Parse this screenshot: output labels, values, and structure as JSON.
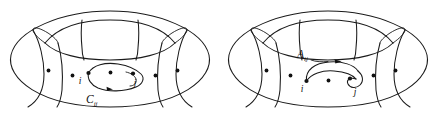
{
  "figure": {
    "background_color": "#ffffff",
    "ink_color": "#1a1a1a",
    "width": 436,
    "height": 124,
    "panels": [
      {
        "id": "left-panel",
        "name": "torus-with-closed-loop",
        "shape": "torus",
        "curve_label": "C",
        "curve_label_subscript": "ij",
        "curve_label_full": "C_ij",
        "curve_type": "closed-oriented-loop",
        "site_labels": [
          "i",
          "j"
        ],
        "site_label_i": "i",
        "site_label_j": "j",
        "lattice_dot_count": 7,
        "lattice_dots": [
          {
            "x": 48.5,
            "y": 70.5
          },
          {
            "x": 72.5,
            "y": 75.5
          },
          {
            "x": 88.5,
            "y": 73.0
          },
          {
            "x": 110.5,
            "y": 72.5
          },
          {
            "x": 133.0,
            "y": 73.5
          },
          {
            "x": 155.5,
            "y": 75.5
          },
          {
            "x": 177.5,
            "y": 70.5
          }
        ]
      },
      {
        "id": "right-panel",
        "name": "torus-with-directed-path",
        "shape": "torus",
        "curve_label": "A",
        "curve_label_subscript": "ij",
        "curve_label_full": "A_ij",
        "curve_type": "directed-path-with-loop",
        "site_labels": [
          "i",
          "j"
        ],
        "site_label_i": "i",
        "site_label_j": "j",
        "lattice_dot_count": 7,
        "lattice_dots": [
          {
            "x": 266.5,
            "y": 70.5
          },
          {
            "x": 290.5,
            "y": 75.5
          },
          {
            "x": 306.5,
            "y": 81.0
          },
          {
            "x": 328.5,
            "y": 80.5
          },
          {
            "x": 350.0,
            "y": 78.5
          },
          {
            "x": 373.5,
            "y": 75.5
          },
          {
            "x": 395.5,
            "y": 70.5
          }
        ]
      }
    ]
  }
}
